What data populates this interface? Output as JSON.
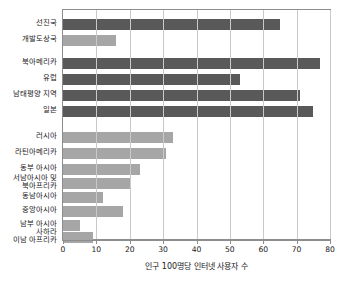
{
  "chart_data": {
    "type": "bar",
    "orientation": "horizontal",
    "title": "",
    "subtitle": "",
    "xlabel": "인구 100명당 인터넷 사용자 수",
    "ylabel": "",
    "xlim": [
      0,
      80
    ],
    "xticks": [
      0,
      10,
      20,
      30,
      40,
      50,
      60,
      70,
      80
    ],
    "grid": true,
    "legend": "none",
    "categories": [
      "선진국",
      "개발도상국",
      "북아메리카",
      "유럽",
      "남태평양 지역",
      "일본",
      "러시아",
      "라틴아메리카",
      "동부 아시아",
      "서남아시아 및\n북아프리카",
      "동남아시아",
      "중앙아시아",
      "남부 아시아",
      "사하라\n이남 아프리카"
    ],
    "values": [
      65,
      16,
      77,
      53,
      71,
      75,
      33,
      31,
      23,
      20,
      12,
      18,
      5,
      9
    ],
    "colors": {
      "dark": "#595959",
      "light": "#a6a6a6",
      "grid": "#c9c9c9",
      "axis": "#8d8d8d",
      "background": "#ffffff",
      "text": "#1a1a1a"
    },
    "bar_styles": [
      "dark",
      "light",
      "dark",
      "dark",
      "dark",
      "dark",
      "light",
      "light",
      "light",
      "light",
      "light",
      "light",
      "light",
      "light"
    ]
  }
}
